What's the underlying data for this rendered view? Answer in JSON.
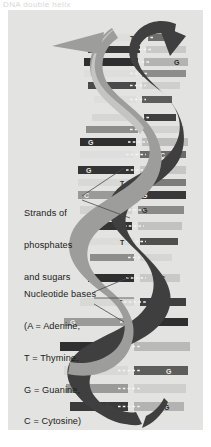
{
  "figure": {
    "top_caption": "DNA double helix",
    "panel_color": "#e3e3e1",
    "page_color": "#ffffff"
  },
  "labels": {
    "strands": {
      "name": "strands-of-phosphates-and-sugars",
      "line1": "Strands of",
      "line2": "phosphates",
      "line3": "and sugars"
    },
    "bases": {
      "name": "nucleotide-bases-legend",
      "line1": "Nucleotide bases",
      "line2": "(A = Adenine,",
      "line3": "T = Thymine,",
      "line4": "G = Guanine,",
      "line5": "C = Cytosine)"
    }
  },
  "legend_keys": [
    {
      "letter": "A",
      "meaning": "Adenine"
    },
    {
      "letter": "T",
      "meaning": "Thymine"
    },
    {
      "letter": "G",
      "meaning": "Guanine"
    },
    {
      "letter": "C",
      "meaning": "Cytosine"
    }
  ],
  "colors": {
    "ribbon_dark": "#3f3f3f",
    "ribbon_mid": "#8d8d8b",
    "ribbon_light": "#b9b9b7",
    "rung_dark": "#2f2f2f",
    "rung_light": "#dedede",
    "rung_mid": "#9a9a98",
    "bond_dash": "#f2f2f2",
    "leader_line": "#4a4a4a",
    "text": "#1b1b1b"
  },
  "helix": {
    "backbone_label": "sugar-phosphate backbone",
    "turns": 4,
    "rung_count": 22,
    "rungs": [
      {
        "i": 0,
        "y": 28,
        "left": "",
        "right": "T",
        "tone": "light"
      },
      {
        "i": 1,
        "y": 40,
        "left": "",
        "right": "",
        "tone": "light"
      },
      {
        "i": 2,
        "y": 52,
        "left": "",
        "right": "G",
        "tone": "dark"
      },
      {
        "i": 3,
        "y": 64,
        "left": "",
        "right": "",
        "tone": "mid"
      },
      {
        "i": 4,
        "y": 76,
        "left": "",
        "right": "",
        "tone": "light"
      },
      {
        "i": 5,
        "y": 92,
        "left": "",
        "right": "",
        "tone": "dark"
      },
      {
        "i": 6,
        "y": 108,
        "left": "",
        "right": "T",
        "tone": "light"
      },
      {
        "i": 7,
        "y": 120,
        "left": "",
        "right": "",
        "tone": "mid"
      },
      {
        "i": 8,
        "y": 132,
        "left": "G",
        "right": "",
        "tone": "dark"
      },
      {
        "i": 9,
        "y": 144,
        "left": "",
        "right": "C",
        "tone": "light"
      },
      {
        "i": 10,
        "y": 160,
        "left": "G",
        "right": "",
        "tone": "dark"
      },
      {
        "i": 11,
        "y": 172,
        "left": "",
        "right": "T",
        "tone": "light"
      },
      {
        "i": 12,
        "y": 184,
        "left": "C",
        "right": "G",
        "tone": "mid"
      },
      {
        "i": 13,
        "y": 200,
        "left": "",
        "right": "G",
        "tone": "light"
      },
      {
        "i": 14,
        "y": 216,
        "left": "G",
        "right": "",
        "tone": "dark"
      },
      {
        "i": 15,
        "y": 232,
        "left": "",
        "right": "T",
        "tone": "light"
      },
      {
        "i": 16,
        "y": 248,
        "left": "",
        "right": "",
        "tone": "mid"
      },
      {
        "i": 17,
        "y": 268,
        "left": "",
        "right": "C",
        "tone": "dark"
      },
      {
        "i": 18,
        "y": 292,
        "left": "",
        "right": "T",
        "tone": "light"
      },
      {
        "i": 19,
        "y": 312,
        "left": "G",
        "right": "",
        "tone": "mid"
      },
      {
        "i": 20,
        "y": 336,
        "left": "",
        "right": "",
        "tone": "dark"
      },
      {
        "i": 21,
        "y": 360,
        "left": "",
        "right": "G",
        "tone": "light"
      },
      {
        "i": 22,
        "y": 378,
        "left": "T",
        "right": "",
        "tone": "mid"
      },
      {
        "i": 23,
        "y": 396,
        "left": "",
        "right": "G",
        "tone": "dark"
      }
    ]
  }
}
